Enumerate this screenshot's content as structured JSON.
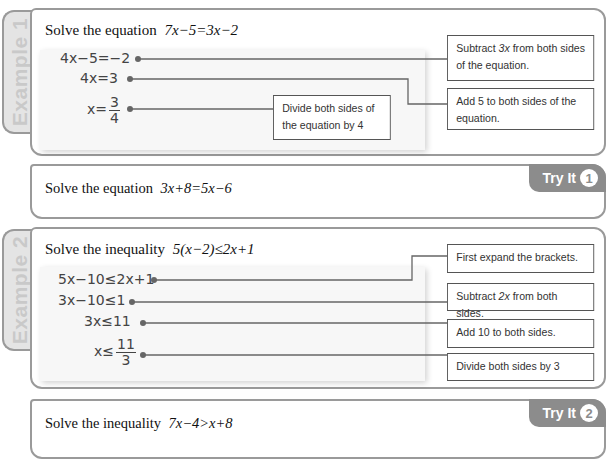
{
  "example1": {
    "tab_label": "Example 1",
    "title_prefix": "Solve the equation",
    "title_math": "7x−5=3x−2",
    "steps": [
      {
        "text": "4x−5=−2"
      },
      {
        "text": "4x=3"
      },
      {
        "prefix": "x=",
        "numerator": "3",
        "denominator": "4"
      }
    ],
    "notes": [
      {
        "pre": "Subtract ",
        "em": "3x",
        "post": " from both sides of the equation."
      },
      {
        "text": "Add 5 to both sides of the equation."
      },
      {
        "text": "Divide both sides of the equation by 4"
      }
    ]
  },
  "tryit1": {
    "question_prefix": "Solve the equation",
    "question_math": "3x+8=5x−6",
    "badge_label": "Try It",
    "badge_number": "1"
  },
  "example2": {
    "tab_label": "Example 2",
    "title_prefix": "Solve the inequality",
    "title_math": "5(x−2)≤2x+1",
    "steps": [
      {
        "text": "5x−10≤2x+1"
      },
      {
        "text": "3x−10≤1"
      },
      {
        "text": "3x≤11"
      },
      {
        "prefix": "x≤",
        "numerator": "11",
        "denominator": "3"
      }
    ],
    "notes": [
      {
        "text": "First expand the brackets."
      },
      {
        "pre": "Subtract ",
        "em": "2x",
        "post": " from both sides."
      },
      {
        "text": "Add 10 to both sides."
      },
      {
        "text": "Divide both sides by 3"
      }
    ]
  },
  "tryit2": {
    "question_prefix": "Solve the inequality",
    "question_math": "7x−4>x+8",
    "badge_label": "Try It",
    "badge_number": "2"
  },
  "colors": {
    "border": "#9a9a9a",
    "tab_fill": "#e4e4e4",
    "tab_text": "#c9c9c9",
    "badge_fill": "#8c8c8c",
    "work_area": "#f7f7f7"
  }
}
